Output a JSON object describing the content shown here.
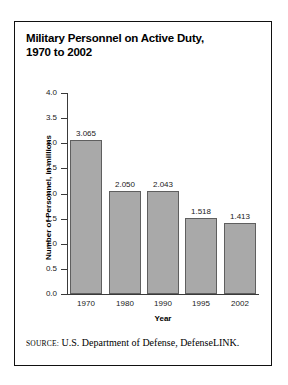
{
  "figure": {
    "title_lines": [
      "Military Personnel on Active Duty,",
      "1970 to 2002"
    ],
    "source_label": "SOURCE:",
    "source_text": "U.S. Department of Defense, DefenseLINK."
  },
  "colors": {
    "bar_fill": "#a9a9a9",
    "bar_stroke": "#5f5f5f",
    "frame": "#111111",
    "axis": "#3a3a3a",
    "text": "#000000"
  },
  "chart_data": {
    "type": "bar",
    "title": "Military Personnel on Active Duty, 1970 to 2002",
    "categories": [
      "1970",
      "1980",
      "1990",
      "1995",
      "2002"
    ],
    "values": [
      3.065,
      2.05,
      2.043,
      1.518,
      1.413
    ],
    "value_labels": [
      "3.065",
      "2.050",
      "2.043",
      "1.518",
      "1.413"
    ],
    "xlabel": "Year",
    "ylabel": "Number of Personnel, in millions",
    "ylim": [
      0.0,
      4.0
    ],
    "yticks": [
      0.0,
      0.5,
      1.0,
      1.5,
      2.0,
      2.5,
      3.0,
      3.5,
      4.0
    ],
    "ytick_labels": [
      "0.0",
      "0.5",
      "1.0",
      "1.5",
      "2.0",
      "2.5",
      "3.0",
      "3.5",
      "4.0"
    ],
    "grid": false,
    "legend": "none"
  }
}
